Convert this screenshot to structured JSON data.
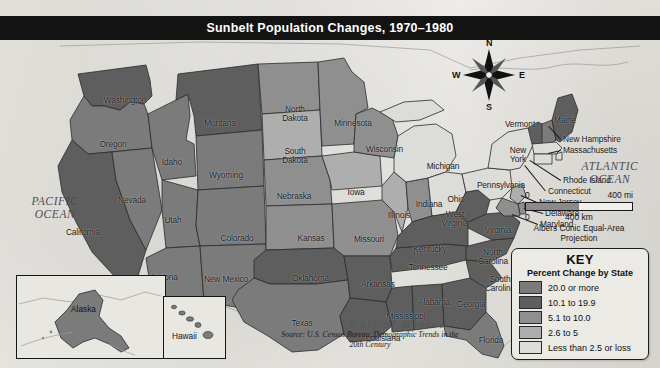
{
  "title": "Sunbelt Population Changes, 1970–1980",
  "oceans": {
    "pacific": "PACIFIC\nOCEAN",
    "atlantic": "ATLANTIC\nOCEAN",
    "gulf": "Gulf of Mexico"
  },
  "compass": {
    "n": "N",
    "e": "E",
    "s": "S",
    "w": "W"
  },
  "scale": {
    "zero_top": "0",
    "miles": "400 mi",
    "zero_bottom": "0",
    "kilometers": "400 km",
    "projection": "Albers Conic Equal-Area\nProjection"
  },
  "key": {
    "title": "KEY",
    "subtitle": "Percent Change by State",
    "entries": [
      {
        "label": "20.0 or more",
        "color": "#7b7b7b",
        "class": "c5"
      },
      {
        "label": "10.1 to 19.9",
        "color": "#5e5e5e",
        "class": "c4"
      },
      {
        "label": "5.1 to 10.0",
        "color": "#8f8f8f",
        "class": "c3"
      },
      {
        "label": "2.6 to 5",
        "color": "#aeaeae",
        "class": "c2"
      },
      {
        "label": "Less than 2.5 or loss",
        "color": "#dcdcd8",
        "class": "c1"
      }
    ]
  },
  "source": "Source: U.S. Census Bureau, Demographic Trends in the 20th Century",
  "insets": {
    "alaska": "Alaska",
    "hawaii": "Hawaii"
  },
  "chart_data": {
    "type": "map",
    "title": "Sunbelt Population Changes, 1970–1980",
    "measure": "Percent Change by State",
    "bins": [
      "20.0 or more",
      "10.1 to 19.9",
      "5.1 to 10.0",
      "2.6 to 5",
      "Less than 2.5 or loss"
    ],
    "states": [
      {
        "name": "Washington",
        "bin": "10.1 to 19.9"
      },
      {
        "name": "Oregon",
        "bin": "20.0 or more"
      },
      {
        "name": "Idaho",
        "bin": "20.0 or more"
      },
      {
        "name": "Montana",
        "bin": "10.1 to 19.9"
      },
      {
        "name": "Wyoming",
        "bin": "20.0 or more"
      },
      {
        "name": "Nevada",
        "bin": "20.0 or more"
      },
      {
        "name": "Utah",
        "bin": "20.0 or more"
      },
      {
        "name": "California",
        "bin": "10.1 to 19.9"
      },
      {
        "name": "Arizona",
        "bin": "20.0 or more"
      },
      {
        "name": "Colorado",
        "bin": "20.0 or more"
      },
      {
        "name": "New Mexico",
        "bin": "20.0 or more"
      },
      {
        "name": "North Dakota",
        "bin": "5.1 to 10.0"
      },
      {
        "name": "South Dakota",
        "bin": "2.6 to 5"
      },
      {
        "name": "Nebraska",
        "bin": "5.1 to 10.0"
      },
      {
        "name": "Kansas",
        "bin": "5.1 to 10.0"
      },
      {
        "name": "Oklahoma",
        "bin": "10.1 to 19.9"
      },
      {
        "name": "Texas",
        "bin": "20.0 or more"
      },
      {
        "name": "Minnesota",
        "bin": "5.1 to 10.0"
      },
      {
        "name": "Iowa",
        "bin": "2.6 to 5"
      },
      {
        "name": "Missouri",
        "bin": "5.1 to 10.0"
      },
      {
        "name": "Arkansas",
        "bin": "10.1 to 19.9"
      },
      {
        "name": "Louisiana",
        "bin": "10.1 to 19.9"
      },
      {
        "name": "Wisconsin",
        "bin": "5.1 to 10.0"
      },
      {
        "name": "Illinois",
        "bin": "2.6 to 5"
      },
      {
        "name": "Michigan",
        "bin": "Less than 2.5 or loss"
      },
      {
        "name": "Indiana",
        "bin": "5.1 to 10.0"
      },
      {
        "name": "Ohio",
        "bin": "Less than 2.5 or loss"
      },
      {
        "name": "Kentucky",
        "bin": "10.1 to 19.9"
      },
      {
        "name": "Tennessee",
        "bin": "10.1 to 19.9"
      },
      {
        "name": "Mississippi",
        "bin": "10.1 to 19.9"
      },
      {
        "name": "Alabama",
        "bin": "10.1 to 19.9"
      },
      {
        "name": "Georgia",
        "bin": "10.1 to 19.9"
      },
      {
        "name": "Florida",
        "bin": "20.0 or more"
      },
      {
        "name": "South Carolina",
        "bin": "10.1 to 19.9"
      },
      {
        "name": "North Carolina",
        "bin": "10.1 to 19.9"
      },
      {
        "name": "Virginia",
        "bin": "10.1 to 19.9"
      },
      {
        "name": "West Virginia",
        "bin": "10.1 to 19.9"
      },
      {
        "name": "Pennsylvania",
        "bin": "Less than 2.5 or loss"
      },
      {
        "name": "New York",
        "bin": "Less than 2.5 or loss"
      },
      {
        "name": "Vermont",
        "bin": "10.1 to 19.9"
      },
      {
        "name": "New Hampshire",
        "bin": "20.0 or more"
      },
      {
        "name": "Maine",
        "bin": "10.1 to 19.9"
      },
      {
        "name": "Massachusetts",
        "bin": "Less than 2.5 or loss"
      },
      {
        "name": "Rhode Island",
        "bin": "Less than 2.5 or loss"
      },
      {
        "name": "Connecticut",
        "bin": "Less than 2.5 or loss"
      },
      {
        "name": "New Jersey",
        "bin": "2.6 to 5"
      },
      {
        "name": "Delaware",
        "bin": "5.1 to 10.0"
      },
      {
        "name": "Maryland",
        "bin": "5.1 to 10.0"
      },
      {
        "name": "Alaska",
        "bin": "20.0 or more"
      },
      {
        "name": "Hawaii",
        "bin": "20.0 or more"
      }
    ]
  },
  "labels": [
    {
      "id": "washington",
      "text": "Washington",
      "x": 94,
      "y": 56,
      "w": 62
    },
    {
      "id": "oregon",
      "text": "Oregon",
      "x": 90,
      "y": 100,
      "w": 46
    },
    {
      "id": "idaho",
      "text": "Idaho",
      "x": 155,
      "y": 118,
      "w": 34
    },
    {
      "id": "montana",
      "text": "Montana",
      "x": 195,
      "y": 79,
      "w": 50
    },
    {
      "id": "wyoming",
      "text": "Wyoming",
      "x": 200,
      "y": 131,
      "w": 52
    },
    {
      "id": "nevada",
      "text": "Nevada",
      "x": 110,
      "y": 156,
      "w": 44
    },
    {
      "id": "utah",
      "text": "Utah",
      "x": 158,
      "y": 176,
      "w": 30
    },
    {
      "id": "california",
      "text": "California",
      "x": 54,
      "y": 188,
      "w": 58
    },
    {
      "id": "arizona",
      "text": "Arizona",
      "x": 141,
      "y": 233,
      "w": 46
    },
    {
      "id": "new-mexico",
      "text": "New Mexico",
      "x": 194,
      "y": 235,
      "w": 64
    },
    {
      "id": "colorado",
      "text": "Colorado",
      "x": 211,
      "y": 194,
      "w": 52
    },
    {
      "id": "north-dakota",
      "text": "North\nDakota",
      "x": 274,
      "y": 65,
      "w": 42
    },
    {
      "id": "south-dakota",
      "text": "South\nDakota",
      "x": 274,
      "y": 107,
      "w": 42
    },
    {
      "id": "nebraska",
      "text": "Nebraska",
      "x": 268,
      "y": 152,
      "w": 52
    },
    {
      "id": "kansas",
      "text": "Kansas",
      "x": 289,
      "y": 194,
      "w": 44
    },
    {
      "id": "oklahoma",
      "text": "Oklahoma",
      "x": 283,
      "y": 234,
      "w": 55
    },
    {
      "id": "texas",
      "text": "Texas",
      "x": 283,
      "y": 279,
      "w": 38
    },
    {
      "id": "minnesota",
      "text": "Minnesota",
      "x": 325,
      "y": 79,
      "w": 56
    },
    {
      "id": "wisconsin",
      "text": "Wisconsin",
      "x": 357,
      "y": 105,
      "w": 55
    },
    {
      "id": "iowa",
      "text": "Iowa",
      "x": 341,
      "y": 148,
      "w": 30
    },
    {
      "id": "missouri",
      "text": "Missouri",
      "x": 345,
      "y": 195,
      "w": 48
    },
    {
      "id": "arkansas",
      "text": "Arkansas",
      "x": 352,
      "y": 240,
      "w": 52
    },
    {
      "id": "louisiana",
      "text": "Louisiana",
      "x": 357,
      "y": 294,
      "w": 52
    },
    {
      "id": "mississippi",
      "text": "Mississippi",
      "x": 376,
      "y": 272,
      "w": 60
    },
    {
      "id": "alabama",
      "text": "Alabama",
      "x": 409,
      "y": 258,
      "w": 50
    },
    {
      "id": "georgia",
      "text": "Georgia",
      "x": 448,
      "y": 260,
      "w": 46
    },
    {
      "id": "florida",
      "text": "Florida",
      "x": 470,
      "y": 296,
      "w": 42
    },
    {
      "id": "tennessee",
      "text": "Tennessee",
      "x": 399,
      "y": 223,
      "w": 58
    },
    {
      "id": "kentucky",
      "text": "Kentucky",
      "x": 404,
      "y": 205,
      "w": 52
    },
    {
      "id": "illinois",
      "text": "Illinois",
      "x": 379,
      "y": 171,
      "w": 40
    },
    {
      "id": "indiana",
      "text": "Indiana",
      "x": 407,
      "y": 160,
      "w": 44
    },
    {
      "id": "ohio",
      "text": "Ohio",
      "x": 441,
      "y": 155,
      "w": 30
    },
    {
      "id": "michigan",
      "text": "Michigan",
      "x": 418,
      "y": 122,
      "w": 50
    },
    {
      "id": "pennsylvania",
      "text": "Pennsylvania",
      "x": 468,
      "y": 141,
      "w": 66
    },
    {
      "id": "west-virginia",
      "text": "West\nVirginia",
      "x": 434,
      "y": 170,
      "w": 42
    },
    {
      "id": "virginia",
      "text": "Virginia",
      "x": 476,
      "y": 186,
      "w": 44
    },
    {
      "id": "north-carolina",
      "text": "North\nCarolina",
      "x": 470,
      "y": 208,
      "w": 46
    },
    {
      "id": "south-carolina",
      "text": "South\nCarolina",
      "x": 477,
      "y": 235,
      "w": 46
    },
    {
      "id": "new-york",
      "text": "New\nYork",
      "x": 503,
      "y": 106,
      "w": 30
    },
    {
      "id": "vermont",
      "text": "Vermont",
      "x": 497,
      "y": 80,
      "w": 46
    },
    {
      "id": "maine",
      "text": "Maine",
      "x": 547,
      "y": 76,
      "w": 36
    }
  ],
  "callouts": [
    {
      "id": "new-hampshire",
      "text": "New Hampshire",
      "x": 563,
      "y": 95
    },
    {
      "id": "massachusetts",
      "text": "Massachusetts",
      "x": 563,
      "y": 106
    },
    {
      "id": "rhode-island",
      "text": "Rhode Island",
      "x": 563,
      "y": 136
    },
    {
      "id": "connecticut",
      "text": "Connecticut",
      "x": 548,
      "y": 147
    },
    {
      "id": "new-jersey",
      "text": "New Jersey",
      "x": 539,
      "y": 158
    },
    {
      "id": "delaware",
      "text": "Delaware",
      "x": 545,
      "y": 169
    },
    {
      "id": "maryland",
      "text": "Maryland",
      "x": 540,
      "y": 180
    }
  ]
}
